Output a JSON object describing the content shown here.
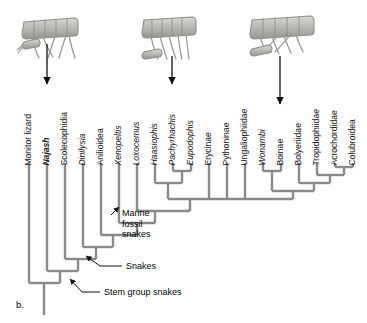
{
  "figure": {
    "panel_label": "b.",
    "tree_color": "#8a8a8a",
    "text_color": "#111111"
  },
  "taxa": [
    {
      "name": "Monitor lizard",
      "style": "plain"
    },
    {
      "name": "Najash",
      "style": "bold-italic"
    },
    {
      "name": "Scolecophidia",
      "style": "plain"
    },
    {
      "name": "Dinilysia",
      "style": "italic"
    },
    {
      "name": "Anilioidea",
      "style": "plain"
    },
    {
      "name": "Xenopeltis",
      "style": "italic"
    },
    {
      "name": "Loxocemus",
      "style": "italic"
    },
    {
      "name": "Haasiophis",
      "style": "italic"
    },
    {
      "name": "Pachyrhachis",
      "style": "italic"
    },
    {
      "name": "Eupodophis",
      "style": "italic"
    },
    {
      "name": "Erycinae",
      "style": "plain"
    },
    {
      "name": "Pythoninae",
      "style": "plain"
    },
    {
      "name": "Ungaliophiidae",
      "style": "plain"
    },
    {
      "name": "Wonambi",
      "style": "italic"
    },
    {
      "name": "Boinae",
      "style": "plain"
    },
    {
      "name": "Bolyeriidae",
      "style": "plain"
    },
    {
      "name": "Tropidophiidae",
      "style": "plain"
    },
    {
      "name": "Acrochordidae",
      "style": "plain"
    },
    {
      "name": "Colubroidea",
      "style": "plain"
    }
  ],
  "annotations": {
    "marine": "Marine\nfossil\nsnakes",
    "marine_line1": "Marine",
    "marine_line2": "fossil",
    "marine_line3": "snakes",
    "snakes": "Snakes",
    "stem_group_snakes": "Stem group snakes"
  },
  "specimen_images": [
    {
      "name": "vertebrae-specimen-najash",
      "points_to": "Najash"
    },
    {
      "name": "vertebrae-specimen-pachyrhachis",
      "points_to": "Pachyrhachis"
    },
    {
      "name": "vertebrae-specimen-boinae",
      "points_to": "Boinae"
    }
  ],
  "chart_data": {
    "type": "diagram",
    "subtype": "cladogram",
    "title": "",
    "tips": [
      "Monitor lizard",
      "Najash",
      "Scolecophidia",
      "Dinilysia",
      "Anilioidea",
      "Xenopeltis",
      "Loxocemus",
      "Haasiophis",
      "Pachyrhachis",
      "Eupodophis",
      "Erycinae",
      "Pythoninae",
      "Ungaliophiidae",
      "Wonambi",
      "Boinae",
      "Bolyeriidae",
      "Tropidophiidae",
      "Acrochordidae",
      "Colubroidea"
    ],
    "newick": "(Monitor lizard,(Najash,(Scolecophidia,(Dinilysia,(Anilioidea,(Xenopeltis,(Loxocemus,((Haasiophis,(Pachyrhachis,Eupodophis)),(Erycinae,Pythoninae,Ungaliophiidae,((Wonambi,Boinae),(Bolyeriidae,(Tropidophiidae,(Acrochordidae,Colubroidea)))))))))))));",
    "clade_labels": [
      {
        "label": "Stem group snakes",
        "node": "Najash+"
      },
      {
        "label": "Snakes",
        "node": "Scolecophidia+"
      },
      {
        "label": "Marine fossil snakes",
        "node": "Haasiophis+Pachyrhachis+Eupodophis"
      }
    ]
  }
}
